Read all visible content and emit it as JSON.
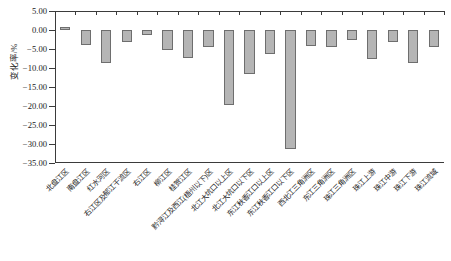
{
  "chart_data": {
    "type": "bar",
    "title": "",
    "xlabel": "",
    "ylabel": "变化率/%",
    "ylim": [
      -35,
      5
    ],
    "ytick_step": 5,
    "grid": false,
    "legend": "none",
    "bar_color": "#b5b5b5",
    "bar_edge_color": "#6e6e6e",
    "axis_color": "#3b3b3b",
    "ytick_labels": [
      "5.00",
      "0.00",
      "-5.00",
      "-10.00",
      "-15.00",
      "-20.00",
      "-25.00",
      "-30.00",
      "-35.00"
    ],
    "ytick_values": [
      5,
      0,
      -5,
      -10,
      -15,
      -20,
      -25,
      -30,
      -35
    ],
    "categories": [
      "北盘江区",
      "南盘江区",
      "红水河区",
      "右江区及郁江干流区",
      "右江区",
      "柳江区",
      "桂贺江区",
      "黔浔江及西江(梧州以下)区",
      "北江大坑口以上区",
      "北江大坑口以下区",
      "东江秋香江口以上区",
      "东江秋香江口以下区",
      "西北江三角洲区",
      "东江三角洲区",
      "珠江三角洲区",
      "珠江上游",
      "珠江中游",
      "珠江下游",
      "珠江流域"
    ],
    "values": [
      0.9,
      -4.0,
      -8.6,
      -3.2,
      -1.3,
      -5.2,
      -7.3,
      -4.6,
      -19.8,
      -11.5,
      -6.2,
      -31.4,
      -4.1,
      -4.4,
      -2.6,
      -7.6,
      -3.1,
      -8.6,
      -4.5
    ]
  }
}
